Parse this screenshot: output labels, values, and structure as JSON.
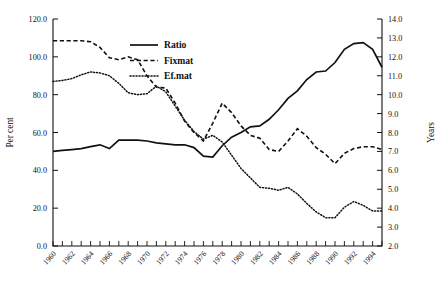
{
  "chart_data": {
    "type": "line",
    "title": "",
    "subtitle": "",
    "xlabel": "",
    "ylabel": "Per cent",
    "y2label": "Years",
    "grid": false,
    "legend_position": "top-center",
    "xlim": [
      1960,
      1995
    ],
    "ylim": [
      0.0,
      120.0
    ],
    "y2lim": [
      2.0,
      14.0
    ],
    "yticks": [
      "0.0",
      "20.0",
      "40.0",
      "60.0",
      "80.0",
      "100.0",
      "120.0"
    ],
    "ytick_values": [
      0.0,
      20.0,
      40.0,
      60.0,
      80.0,
      100.0,
      120.0
    ],
    "y2ticks": [
      "2.0",
      "3.0",
      "4.0",
      "5.0",
      "6.0",
      "7.0",
      "8.0",
      "9.0",
      "10.0",
      "11.0",
      "12.0",
      "13.0",
      "14.0"
    ],
    "y2tick_values": [
      2.0,
      3.0,
      4.0,
      5.0,
      6.0,
      7.0,
      8.0,
      9.0,
      10.0,
      11.0,
      12.0,
      13.0,
      14.0
    ],
    "xticks": [
      "1960",
      "1962",
      "1964",
      "1966",
      "1968",
      "1970",
      "1972",
      "1974",
      "1976",
      "1978",
      "1980",
      "1982",
      "1984",
      "1986",
      "1988",
      "1990",
      "1992",
      "1994"
    ],
    "xtick_values": [
      1960,
      1962,
      1964,
      1966,
      1968,
      1970,
      1972,
      1974,
      1976,
      1978,
      1980,
      1982,
      1984,
      1986,
      1988,
      1990,
      1992,
      1994
    ],
    "x": [
      1960,
      1961,
      1962,
      1963,
      1964,
      1965,
      1966,
      1967,
      1968,
      1969,
      1970,
      1971,
      1972,
      1973,
      1974,
      1975,
      1976,
      1977,
      1978,
      1979,
      1980,
      1981,
      1982,
      1983,
      1984,
      1985,
      1986,
      1987,
      1988,
      1989,
      1990,
      1991,
      1992,
      1993,
      1994,
      1995
    ],
    "series": [
      {
        "name": "Ratio",
        "style": "solid",
        "axis": "left",
        "units": "per cent",
        "values": [
          50.0,
          50.5,
          51.0,
          51.5,
          52.5,
          53.5,
          51.5,
          56.0,
          56.0,
          56.0,
          55.5,
          54.5,
          54.0,
          53.5,
          53.5,
          52.0,
          47.5,
          47.0,
          53.0,
          57.5,
          60.0,
          63.0,
          63.5,
          67.0,
          72.0,
          78.0,
          82.0,
          88.0,
          92.0,
          92.5,
          97.0,
          104.0,
          107.0,
          107.5,
          104.0,
          94.5
        ]
      },
      {
        "name": "Fixmat",
        "style": "dashed",
        "axis": "right",
        "units": "years",
        "values": [
          12.85,
          12.85,
          12.85,
          12.85,
          12.8,
          12.5,
          11.95,
          11.85,
          12.0,
          11.85,
          11.0,
          10.4,
          10.35,
          9.55,
          8.6,
          8.0,
          7.55,
          8.5,
          9.55,
          9.05,
          8.35,
          7.85,
          7.7,
          7.1,
          7.0,
          7.55,
          8.2,
          7.8,
          7.2,
          6.85,
          6.35,
          6.9,
          7.15,
          7.25,
          7.25,
          7.1
        ]
      },
      {
        "name": "Ef.mat",
        "style": "dotted",
        "axis": "left",
        "units": "per cent",
        "values": [
          87.0,
          87.5,
          88.5,
          90.5,
          92.0,
          91.5,
          90.0,
          86.0,
          81.0,
          80.0,
          80.5,
          84.5,
          81.5,
          74.0,
          66.5,
          60.5,
          56.5,
          58.5,
          55.0,
          48.0,
          41.0,
          36.0,
          31.0,
          30.5,
          29.5,
          31.0,
          27.5,
          22.5,
          18.0,
          15.0,
          15.0,
          20.5,
          23.5,
          21.5,
          18.5,
          18.5
        ]
      }
    ],
    "legend": [
      {
        "label": "Ratio",
        "style": "solid"
      },
      {
        "label": "Fixmat",
        "style": "dashed"
      },
      {
        "label": "Ef.mat",
        "style": "dotted"
      }
    ]
  }
}
